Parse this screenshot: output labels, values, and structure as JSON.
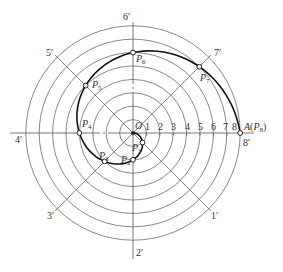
{
  "diagram": {
    "center": {
      "label": "O",
      "x": 133,
      "y": 133
    },
    "division_count": 8,
    "radius_step": 13.4,
    "colors": {
      "line": "#555555",
      "curve": "#111111",
      "point_fill": "#ffffff",
      "text": "#333333"
    },
    "axis_labels": [
      {
        "id": "1p",
        "text": "1′",
        "x": 211,
        "y": 219
      },
      {
        "id": "2p",
        "text": "2′",
        "x": 136,
        "y": 256
      },
      {
        "id": "3p",
        "text": "3′",
        "x": 47,
        "y": 219
      },
      {
        "id": "4p",
        "text": "4′",
        "x": 15,
        "y": 143
      },
      {
        "id": "5p",
        "text": "5′",
        "x": 46,
        "y": 56
      },
      {
        "id": "6p",
        "text": "6′",
        "x": 123,
        "y": 20
      },
      {
        "id": "7p",
        "text": "7′",
        "x": 214,
        "y": 56
      },
      {
        "id": "8p",
        "text": "8′",
        "x": 243,
        "y": 146
      }
    ],
    "tick_labels": [
      {
        "text": "1",
        "x": 145,
        "y": 130
      },
      {
        "text": "2",
        "x": 158,
        "y": 130
      },
      {
        "text": "3",
        "x": 171,
        "y": 130
      },
      {
        "text": "4",
        "x": 185,
        "y": 130
      },
      {
        "text": "5",
        "x": 198,
        "y": 130
      },
      {
        "text": "6",
        "x": 211,
        "y": 130
      },
      {
        "text": "7",
        "x": 223,
        "y": 130
      },
      {
        "text": "8",
        "x": 232,
        "y": 130
      }
    ],
    "points": [
      {
        "name": "P",
        "sub": "1",
        "x": 142.5,
        "y": 142.5,
        "lx": 132,
        "ly": 151
      },
      {
        "name": "P",
        "sub": "2",
        "x": 133,
        "y": 159.8,
        "lx": 121,
        "ly": 163
      },
      {
        "name": "P",
        "sub": "3",
        "x": 104.6,
        "y": 161.4,
        "lx": 99,
        "ly": 159
      },
      {
        "name": "P",
        "sub": "4",
        "x": 79.4,
        "y": 133,
        "lx": 82,
        "ly": 127
      },
      {
        "name": "P",
        "sub": "5",
        "x": 85.6,
        "y": 85.6,
        "lx": 92,
        "ly": 88
      },
      {
        "name": "P",
        "sub": "6",
        "x": 133,
        "y": 52.6,
        "lx": 136,
        "ly": 62
      },
      {
        "name": "P",
        "sub": "7",
        "x": 199.3,
        "y": 66.7,
        "lx": 200,
        "ly": 81
      },
      {
        "name": "A",
        "sub": "8",
        "x": 240.2,
        "y": 133,
        "lx": 244,
        "ly": 130
      }
    ],
    "endpoint_label": {
      "prefix": "A(",
      "name": "P",
      "sub": "8",
      "suffix": ")"
    }
  }
}
